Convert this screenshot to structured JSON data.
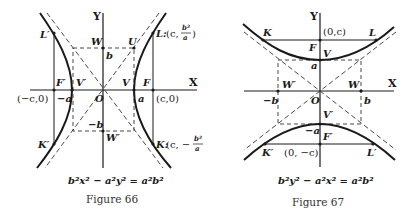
{
  "figure66": {
    "caption": "Figure 66",
    "equation": "b²x² − a²y² = a²b²",
    "axis_x": "X",
    "axis_y": "Y",
    "labels": {
      "L_prime": "L′",
      "L": "L:",
      "L_coord_pre": "(c,",
      "L_num": "b²",
      "L_den": "a",
      "L_close": ")",
      "W": "W",
      "U": "U",
      "b": "b",
      "F_prime": "F′",
      "V_prime": "V′",
      "V": "V",
      "F": "F",
      "neg_c": "(−c,0)",
      "neg_a": "−a",
      "O": "O",
      "a": "a",
      "c": "(c,0)",
      "neg_b": "−b",
      "W_prime": "W′",
      "K_prime": "K′",
      "K": "K:",
      "K_coord_pre": "(c, −",
      "K_num": "b²",
      "K_den": "a",
      "K_close": ")"
    }
  },
  "figure67": {
    "caption": "Figure 67",
    "equation": "b²y² − a²x² = a²b²",
    "axis_x": "X",
    "axis_y": "Y",
    "labels": {
      "K": "K",
      "L": "L",
      "focus_top": "(0,c)",
      "F": "F",
      "V": "V",
      "a": "a",
      "W_prime": "W′",
      "W": "W",
      "neg_b": "−b",
      "O": "O",
      "b": "b",
      "V_prime": "V′",
      "neg_a": "−a",
      "F_prime": "F′",
      "K_prime": "K′",
      "focus_bottom": "(0, −c)",
      "L_prime": "L′"
    }
  }
}
